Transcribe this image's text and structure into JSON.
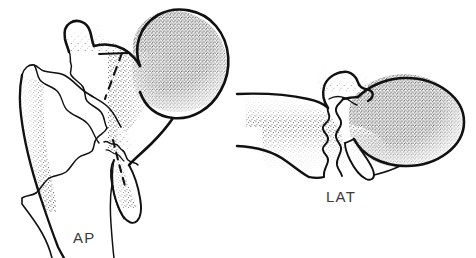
{
  "figure": {
    "style": "pen-and-ink line drawing with stipple shading",
    "background_color": "#ffffff",
    "ink_color": "#111111",
    "stipple_color": "#4a4a4a",
    "width": 476,
    "height": 258
  },
  "views": [
    {
      "id": "ap",
      "label": "AP",
      "label_position": {
        "x": 73,
        "y": 229
      },
      "description": "Anteroposterior projection of proximal femur with displaced fracture; femoral head upper right, greater trochanter upper left, separated femoral shaft fragment at left, dashed occult fracture line through neck",
      "parts": [
        "femoral-head",
        "femoral-neck",
        "greater-trochanter",
        "lesser-trochanter",
        "femoral-shaft-fragment",
        "fracture-line",
        "dashed-fracture-line"
      ]
    },
    {
      "id": "lat",
      "label": "LAT",
      "label_position": {
        "x": 326,
        "y": 188
      },
      "description": "Lateral projection of proximal femur; shaft extends to the left, rounded femoral head at right, jagged vertical fracture line separating the fragments",
      "parts": [
        "femoral-head",
        "femoral-neck",
        "greater-trochanter",
        "femoral-shaft",
        "fracture-line"
      ]
    }
  ],
  "labels": {
    "ap": "AP",
    "lat": "LAT"
  }
}
